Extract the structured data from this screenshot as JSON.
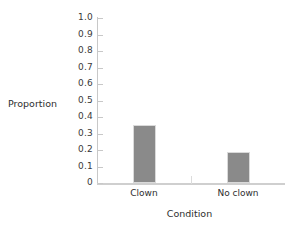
{
  "chart_data": {
    "type": "bar",
    "title": "",
    "xlabel": "Condition",
    "ylabel": "Proportion",
    "categories": [
      "Clown",
      "No clown"
    ],
    "values": [
      0.35,
      0.19
    ],
    "ylim": [
      0,
      1.0
    ],
    "ytick_labels": [
      "1.0",
      "0.9",
      "0.8",
      "0.7",
      "0.6",
      "0.5",
      "0.4",
      "0.3",
      "0.2",
      "0.1",
      "0"
    ],
    "ytick_values": [
      1.0,
      0.9,
      0.8,
      0.7,
      0.6,
      0.5,
      0.4,
      0.3,
      0.2,
      0.1,
      0
    ],
    "grid": false,
    "legend": null,
    "series": [
      {
        "name": "Proportion",
        "values": [
          0.35,
          0.19
        ]
      }
    ],
    "bar_color": "#8a8a8a",
    "axis_color": "#c8c8c8",
    "background": "#ffffff"
  }
}
